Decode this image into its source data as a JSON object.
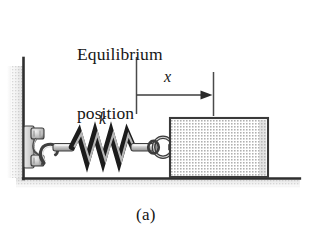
{
  "figure": {
    "caption": "(a)",
    "title_line_1": "Equilibrium",
    "title_line_2": "position",
    "labels": {
      "displacement": "x",
      "spring_constant": "k"
    },
    "colors": {
      "ink": "#161616",
      "outline": "#2b2b2b",
      "block_fill": "#d9d9d9",
      "block_edge": "#3a3a3a",
      "spring_dark": "#1c1c1c",
      "spring_light": "#b9b9b9",
      "metal_fill": "#cfcfcf",
      "metal_edge": "#3d3d3d",
      "shadow": "#c9c9c9",
      "background": "#ffffff"
    },
    "geometry": {
      "wall_x": 23,
      "wall_top_y": 58,
      "ground_y": 178,
      "ground_right_x": 300,
      "equilibrium_tick_x": 136,
      "equilibrium_tick_top_y": 57,
      "equilibrium_tick_bottom_y": 114,
      "block_tick_x": 213,
      "block_tick_top_y": 72,
      "block_tick_bottom_y": 116,
      "arrow_y": 95,
      "spring_left_x": 72,
      "spring_right_x": 137,
      "spring_center_y": 147,
      "spring_amplitude": 14,
      "spring_coils": 4,
      "block_left_x": 170,
      "block_right_x": 268,
      "block_top_y": 118,
      "block_bottom_y": 177
    }
  }
}
